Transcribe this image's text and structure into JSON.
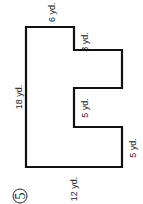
{
  "problem": {
    "number": "5"
  },
  "figure": {
    "stroke_color": "#111111",
    "fill_color": "#ffffff",
    "labels": {
      "top": "6 yd.",
      "step_top": "3 yd.",
      "left": "18 yd.",
      "notch_inner": "5 yd.",
      "bottom_right": "5 yd.",
      "bottom": "12 yd."
    }
  }
}
